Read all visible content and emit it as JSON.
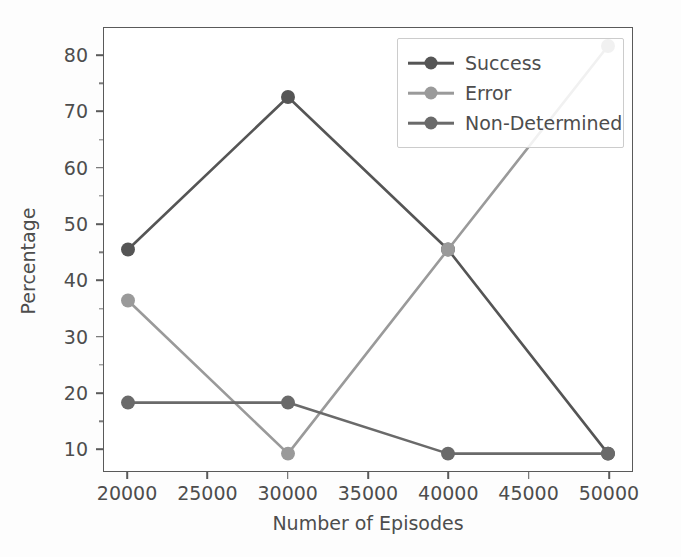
{
  "chart_data": {
    "type": "line",
    "title": "",
    "xlabel": "Number of Episodes",
    "ylabel": "Percentage",
    "x": [
      20000,
      30000,
      40000,
      50000
    ],
    "xlim": [
      18500,
      51500
    ],
    "ylim": [
      6.0,
      85.0
    ],
    "xticks": [
      20000,
      25000,
      30000,
      35000,
      40000,
      45000,
      50000
    ],
    "xticklabels": [
      "20000",
      "25000",
      "30000",
      "35000",
      "40000",
      "45000",
      "50000"
    ],
    "yticks": [
      10,
      20,
      30,
      40,
      50,
      60,
      70,
      80
    ],
    "yticklabels": [
      "10",
      "20",
      "30",
      "40",
      "50",
      "60",
      "70",
      "80"
    ],
    "grid": false,
    "legend_position": "upper right",
    "series": [
      {
        "name": "Success",
        "color": "#555555",
        "values": [
          45.5,
          72.7,
          45.5,
          9.1
        ]
      },
      {
        "name": "Error",
        "color": "#9a9a9a",
        "values": [
          36.4,
          9.1,
          45.5,
          81.8
        ]
      },
      {
        "name": "Non-Determined",
        "color": "#6a6a6a",
        "values": [
          18.2,
          18.2,
          9.1,
          9.1
        ]
      }
    ]
  }
}
